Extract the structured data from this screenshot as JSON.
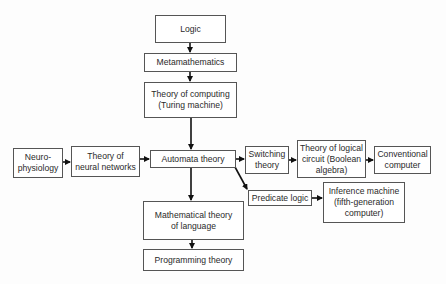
{
  "diagram": {
    "type": "flowchart",
    "nodes": {
      "logic": "Logic",
      "metamathematics": "Metamathematics",
      "theory_of_computing": "Theory of computing\n(Turing machine)",
      "neurophysiology": "Neuro-\nphysiology",
      "neural_networks": "Theory of\nneural networks",
      "automata": "Automata theory",
      "switching": "Switching\ntheory",
      "logical_circuit": "Theory of logical\ncircuit (Boolean\nalgebra)",
      "conventional_computer": "Conventional\ncomputer",
      "predicate_logic": "Predicate logic",
      "inference_machine": "Inference machine\n(fifth-generation\ncomputer)",
      "math_language": "Mathematical theory\nof language",
      "programming": "Programming theory"
    },
    "edges": [
      [
        "logic",
        "metamathematics"
      ],
      [
        "metamathematics",
        "theory_of_computing"
      ],
      [
        "theory_of_computing",
        "automata"
      ],
      [
        "neurophysiology",
        "neural_networks"
      ],
      [
        "neural_networks",
        "automata"
      ],
      [
        "automata",
        "switching"
      ],
      [
        "switching",
        "logical_circuit"
      ],
      [
        "logical_circuit",
        "conventional_computer"
      ],
      [
        "automata",
        "predicate_logic"
      ],
      [
        "predicate_logic",
        "inference_machine"
      ],
      [
        "automata",
        "math_language"
      ],
      [
        "math_language",
        "programming"
      ]
    ]
  }
}
